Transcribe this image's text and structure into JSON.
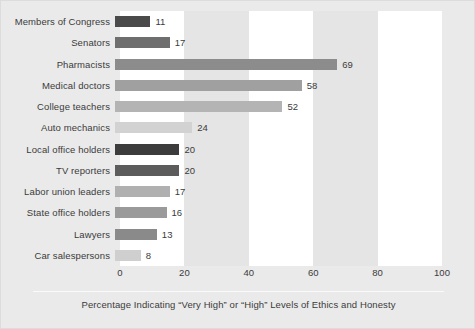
{
  "chart_data": {
    "type": "bar",
    "orientation": "horizontal",
    "title": "",
    "xlabel": "Percentage Indicating “Very High” or “High” Levels of Ethics and Honesty",
    "ylabel": "",
    "xlim": [
      0,
      100
    ],
    "xticks": [
      "0",
      "20",
      "40",
      "60",
      "80",
      "100"
    ],
    "grid": false,
    "legend": null,
    "bands": [
      {
        "from": 0,
        "to": 20,
        "color": "#ffffff"
      },
      {
        "from": 20,
        "to": 40,
        "color": "#e5e5e5"
      },
      {
        "from": 40,
        "to": 60,
        "color": "#ffffff"
      },
      {
        "from": 60,
        "to": 80,
        "color": "#e5e5e5"
      },
      {
        "from": 80,
        "to": 100,
        "color": "#ffffff"
      }
    ],
    "categories": [
      "Members of Congress",
      "Senators",
      "Pharmacists",
      "Medical doctors",
      "College teachers",
      "Auto mechanics",
      "Local office holders",
      "TV reporters",
      "Labor union leaders",
      "State office holders",
      "Lawyers",
      "Car salespersons"
    ],
    "values": [
      11,
      17,
      69,
      58,
      52,
      24,
      20,
      20,
      17,
      16,
      13,
      8
    ],
    "value_labels": [
      "11",
      "17",
      "69",
      "58",
      "52",
      "24",
      "20",
      "20",
      "17",
      "16",
      "13",
      "8"
    ],
    "bar_colors": [
      "#4a4a4a",
      "#6e6e6e",
      "#8c8c8c",
      "#a0a0a0",
      "#b4b4b4",
      "#d2d2d2",
      "#3c3c3c",
      "#5c5c5c",
      "#b0b0b0",
      "#9a9a9a",
      "#8a8a8a",
      "#cfcfcf"
    ]
  },
  "figure": {
    "background_color": "#eaeaea",
    "plot_background_color": "#ffffff",
    "text_color": "#3b3b3b"
  }
}
